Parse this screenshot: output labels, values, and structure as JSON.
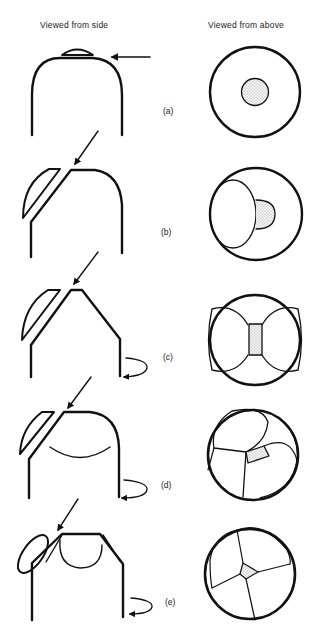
{
  "headers": {
    "side": "Viewed from side",
    "above": "Viewed from above"
  },
  "stages": [
    {
      "label": "(a)",
      "label_pos": [
        163,
        112
      ]
    },
    {
      "label": "(b)",
      "label_pos": [
        161,
        233
      ]
    },
    {
      "label": "(c)",
      "label_pos": [
        163,
        358
      ]
    },
    {
      "label": "(d)",
      "label_pos": [
        161,
        486
      ]
    },
    {
      "label": "(e)",
      "label_pos": [
        165,
        603
      ]
    }
  ],
  "colors": {
    "stroke": "#111111",
    "stipple": "#555555",
    "background": "#ffffff"
  }
}
